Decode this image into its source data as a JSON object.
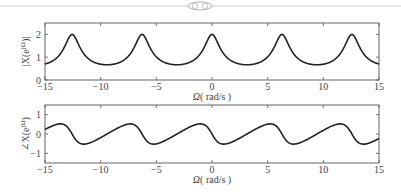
{
  "header": {
    "ornament": "decorative-flourish"
  },
  "chart_data": [
    {
      "type": "line",
      "title": "",
      "xlabel": "Ω (rad/s)",
      "ylabel": "|X(e^{jΩ})|",
      "xlim": [
        -15,
        15
      ],
      "ylim": [
        0,
        2.5
      ],
      "xticks": [
        -15,
        -10,
        -5,
        0,
        5,
        10,
        15
      ],
      "yticks": [
        0,
        1,
        2
      ],
      "grid": false,
      "formula": "1/|1-0.5e^{-jΩ}|",
      "series": [
        {
          "name": "magnitude",
          "peaks_at": [
            -12.566,
            -6.283,
            0,
            6.283,
            12.566
          ],
          "peak_value": 2.0,
          "min_value": 0.667
        }
      ]
    },
    {
      "type": "line",
      "title": "",
      "xlabel": "Ω (rad/s)",
      "ylabel": "∠X(e^{jΩ})",
      "xlim": [
        -15,
        15
      ],
      "ylim": [
        -1.5,
        1.5
      ],
      "xticks": [
        -15,
        -10,
        -5,
        0,
        5,
        10,
        15
      ],
      "yticks": [
        -1,
        0,
        1
      ],
      "grid": false,
      "formula": "-atan(0.5 sinΩ / (1 - 0.5 cosΩ))",
      "series": [
        {
          "name": "phase",
          "max_value": 0.524,
          "min_value": -0.524
        }
      ]
    }
  ],
  "labels": {
    "x_axis": "Ω (rad/s)",
    "omega": "Ω",
    "unit": "( rad/s )",
    "mag_ylabel": "|X(e",
    "phase_ylabel": "∠X(e",
    "sup": "jΩ",
    "close_mag": ")|",
    "close_phase": ")"
  }
}
